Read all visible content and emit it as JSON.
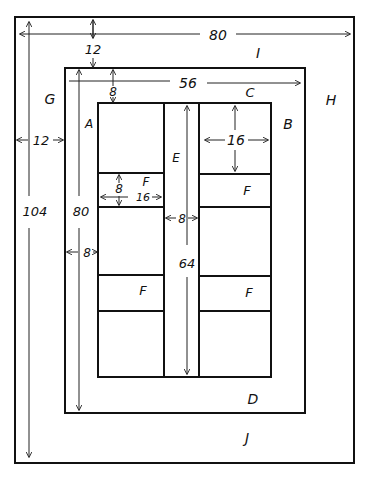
{
  "diagram": {
    "type": "dimensioned layout plan",
    "labels": {
      "A": "A",
      "B": "B",
      "C": "C",
      "D": "D",
      "E": "E",
      "F1": "F",
      "F2": "F",
      "F3": "F",
      "F4": "F",
      "G": "G",
      "H": "H",
      "I": "I",
      "J": "J"
    },
    "dimensions": {
      "outer_width": "80",
      "outer_height": "104",
      "outer_margin_top": "12",
      "outer_margin_side": "12",
      "middle_width": "56",
      "middle_height": "80",
      "middle_margin_top": "8",
      "middle_margin_side": "8",
      "panel_width": "16",
      "panel_height": "16",
      "strip_height": "8",
      "strip_width": "16",
      "center_gap": "8",
      "center_length": "64"
    }
  }
}
